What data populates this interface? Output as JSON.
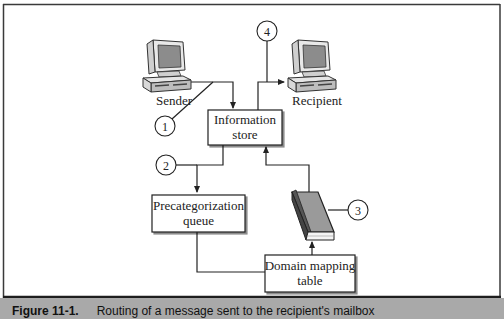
{
  "diagram": {
    "nodes": {
      "sender": {
        "label": "Sender",
        "icon": "computer-icon"
      },
      "recipient": {
        "label": "Recipient",
        "icon": "computer-icon"
      },
      "information_store": {
        "line1": "Information",
        "line2": "store"
      },
      "precategorization_queue": {
        "line1": "Precategorization",
        "line2": "queue"
      },
      "domain_mapping_table": {
        "line1": "Domain mapping",
        "line2": "table"
      },
      "directory": {
        "icon": "book-icon"
      }
    },
    "steps": [
      "1",
      "2",
      "3",
      "4"
    ],
    "edges": [
      {
        "from": "sender",
        "to": "information_store",
        "step": "1"
      },
      {
        "from": "information_store",
        "to": "precategorization_queue",
        "step": "2"
      },
      {
        "from": "precategorization_queue",
        "to": "domain_mapping_table"
      },
      {
        "from": "domain_mapping_table",
        "to": "directory"
      },
      {
        "from": "directory",
        "to": "information_store",
        "step": "3"
      },
      {
        "from": "information_store",
        "to": "recipient",
        "step": "4"
      }
    ]
  },
  "caption": {
    "figure": "Figure 11-1.",
    "text": "Routing of a message sent to the recipient's mailbox"
  },
  "colors": {
    "border": "#3a3a3a",
    "caption_bar": "#a9a9a9",
    "book_cover": "#9a9a9a",
    "line": "#222222"
  }
}
